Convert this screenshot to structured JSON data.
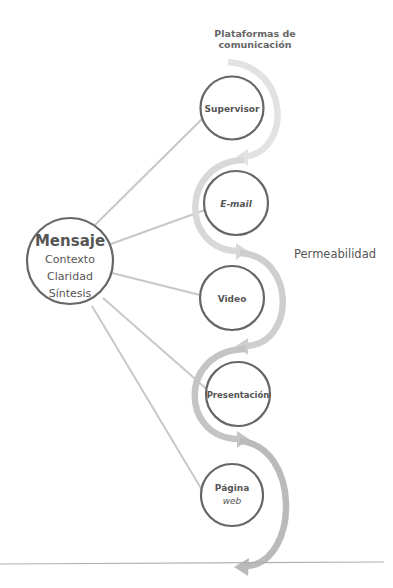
{
  "diagram": {
    "title_line1": "Plataformas de",
    "title_line2": "comunicación",
    "side_label": "Permeabilidad",
    "center_node": {
      "title": "Mensaje",
      "lines": [
        "Contexto",
        "Claridad",
        "Síntesis"
      ]
    },
    "platforms": [
      {
        "label": "Supervisor",
        "italic": false
      },
      {
        "label": "E-mail",
        "italic": true
      },
      {
        "label": "Video",
        "italic": false
      },
      {
        "label": "Presentación",
        "italic": false
      },
      {
        "label": "Página",
        "label2": "web",
        "italic_line2": true
      }
    ],
    "colors": {
      "node_stroke": "#666666",
      "connector": "#c4c4c4",
      "arc_1": "#e0e0e0",
      "arc_2": "#d6d6d6",
      "arc_3": "#cccccc",
      "arc_4": "#c2c2c2",
      "arc_5": "#b8b8b8",
      "divider": "#aaaaaa"
    }
  }
}
